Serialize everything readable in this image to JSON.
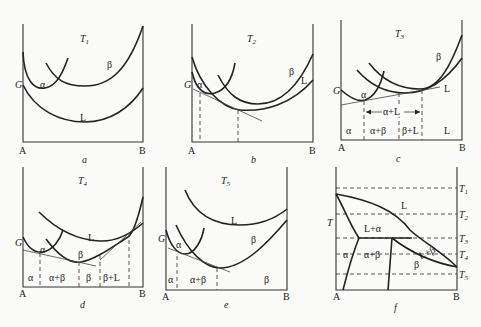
{
  "figure": {
    "panels": [
      {
        "id": "a",
        "caption": "a",
        "temperature": "T",
        "temperature_sub": "1",
        "y_axis": "G",
        "x_left": "A",
        "x_right": "B",
        "curve_labels": [
          "α",
          "β",
          "L"
        ]
      },
      {
        "id": "b",
        "caption": "b",
        "temperature": "T",
        "temperature_sub": "2",
        "y_axis": "G",
        "x_left": "A",
        "x_right": "B",
        "curve_labels": [
          "α",
          "β",
          "L"
        ]
      },
      {
        "id": "c",
        "caption": "c",
        "temperature": "T",
        "temperature_sub": "3",
        "y_axis": "G",
        "x_left": "A",
        "x_right": "B",
        "curve_labels": [
          "α",
          "β",
          "L"
        ],
        "range_label": "α+L",
        "regions": [
          "α",
          "α+β",
          "β+L",
          "L"
        ]
      },
      {
        "id": "d",
        "caption": "d",
        "temperature": "T",
        "temperature_sub": "4",
        "y_axis": "G",
        "x_left": "A",
        "x_right": "B",
        "curve_labels": [
          "α",
          "β",
          "L"
        ],
        "regions": [
          "α",
          "α+β",
          "β",
          "β+L"
        ]
      },
      {
        "id": "e",
        "caption": "e",
        "temperature": "T",
        "temperature_sub": "5",
        "y_axis": "G",
        "x_left": "A",
        "x_right": "B",
        "curve_labels": [
          "α",
          "β",
          "L"
        ],
        "regions": [
          "α",
          "α+β",
          "β"
        ]
      },
      {
        "id": "f",
        "caption": "f",
        "y_axis": "T",
        "x_left": "A",
        "x_right": "B",
        "isotherms": [
          {
            "label": "T",
            "sub": "1"
          },
          {
            "label": "T",
            "sub": "2"
          },
          {
            "label": "T",
            "sub": "3"
          },
          {
            "label": "T",
            "sub": "4"
          },
          {
            "label": "T",
            "sub": "5"
          }
        ],
        "regions": [
          "L",
          "L+α",
          "α",
          "α+β",
          "L+β",
          "β"
        ]
      }
    ]
  }
}
